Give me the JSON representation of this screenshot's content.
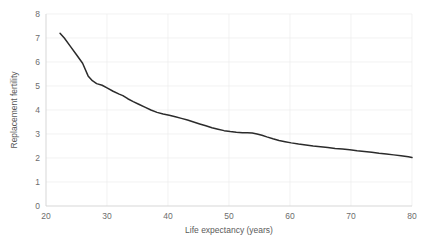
{
  "chart_data": {
    "type": "line",
    "title": "",
    "xlabel": "Life expectancy (years)",
    "ylabel": "Replacement fertility",
    "xlim": [
      20,
      80
    ],
    "ylim": [
      0,
      8
    ],
    "xticks": [
      "20",
      "30",
      "40",
      "50",
      "60",
      "70",
      "80"
    ],
    "yticks": [
      "0",
      "1",
      "2",
      "3",
      "4",
      "5",
      "6",
      "7",
      "8"
    ],
    "grid": true,
    "legend": "none",
    "line_color": "#2b2b2b",
    "series": [
      {
        "name": "Replacement fertility",
        "x": [
          22.3,
          23.0,
          24.0,
          25.0,
          26.0,
          26.9,
          27.6,
          28.3,
          29.2,
          30.0,
          31.0,
          32.0,
          32.6,
          33.4,
          34.3,
          35.2,
          36.2,
          37.2,
          38.2,
          39.2,
          40.2,
          41.2,
          42.2,
          43.2,
          44.2,
          45.2,
          46.2,
          47.2,
          48.2,
          49.2,
          50.2,
          51.2,
          52.2,
          53.0,
          53.8,
          54.6,
          55.4,
          56.2,
          57.2,
          58.2,
          59.2,
          60.2,
          61.4,
          62.6,
          63.8,
          65.0,
          66.2,
          67.4,
          68.6,
          69.8,
          71.0,
          72.2,
          73.4,
          74.6,
          75.8,
          77.0,
          78.2,
          79.4,
          80.0
        ],
        "y": [
          7.2,
          7.0,
          6.65,
          6.3,
          5.95,
          5.42,
          5.22,
          5.1,
          5.03,
          4.92,
          4.78,
          4.66,
          4.6,
          4.47,
          4.35,
          4.24,
          4.12,
          4.0,
          3.9,
          3.83,
          3.78,
          3.72,
          3.65,
          3.58,
          3.5,
          3.42,
          3.34,
          3.26,
          3.2,
          3.14,
          3.1,
          3.07,
          3.05,
          3.05,
          3.04,
          3.0,
          2.95,
          2.88,
          2.8,
          2.73,
          2.68,
          2.63,
          2.58,
          2.54,
          2.5,
          2.47,
          2.44,
          2.4,
          2.37,
          2.34,
          2.3,
          2.27,
          2.24,
          2.2,
          2.17,
          2.13,
          2.09,
          2.05,
          2.02
        ]
      }
    ]
  }
}
